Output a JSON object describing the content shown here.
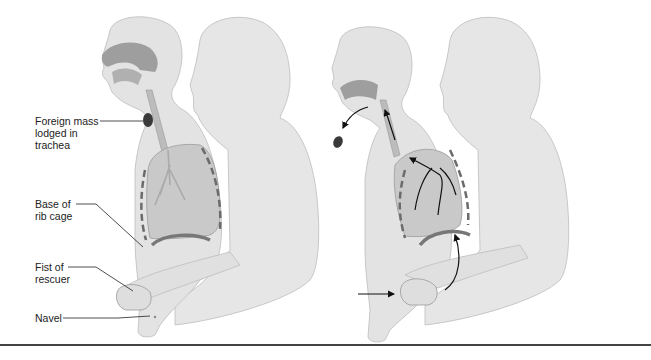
{
  "diagram": {
    "panels": [
      {
        "id": "before",
        "description": "Rescuer positioned behind victim; foreign mass lodged in trachea"
      },
      {
        "id": "after",
        "description": "Upward thrust expels foreign mass; arrows show air flow out of lungs"
      }
    ],
    "labels": [
      {
        "id": "foreign-mass",
        "text": "Foreign mass\nlodged in\ntrachea"
      },
      {
        "id": "rib-cage",
        "text": "Base of\nrib cage"
      },
      {
        "id": "fist",
        "text": "Fist of\nrescuer"
      },
      {
        "id": "navel",
        "text": "Navel"
      }
    ],
    "colors": {
      "body": "#e6e6e6",
      "body_outline": "#b9b9b9",
      "lung": "#c9c9c9",
      "airway": "#9a9a9a",
      "arrow": "#111111",
      "rule": "#444444"
    }
  }
}
